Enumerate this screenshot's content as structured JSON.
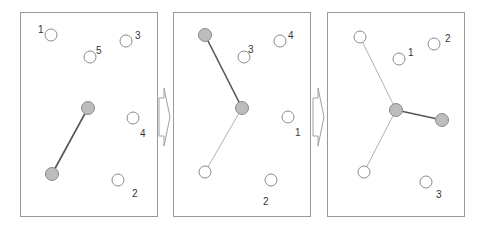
{
  "figure": {
    "colors": {
      "frame": "#9a9a9a",
      "open_node_fill": "#ffffff",
      "filled_node_fill": "#bdbdbd",
      "strong_edge": "#555555",
      "weak_edge": "#a8a8a8",
      "label": "#333333"
    },
    "panels": [
      {
        "id": "step-1",
        "labels": [
          {
            "text": "1",
            "x": 38,
            "y": 33
          },
          {
            "text": "5",
            "x": 96,
            "y": 54
          },
          {
            "text": "3",
            "x": 135,
            "y": 39
          },
          {
            "text": "4",
            "x": 140,
            "y": 137
          },
          {
            "text": "2",
            "x": 132,
            "y": 197
          }
        ]
      },
      {
        "id": "step-2",
        "labels": [
          {
            "text": "3",
            "x": 248,
            "y": 53
          },
          {
            "text": "4",
            "x": 288,
            "y": 39
          },
          {
            "text": "1",
            "x": 295,
            "y": 136
          },
          {
            "text": "2",
            "x": 263,
            "y": 205
          }
        ]
      },
      {
        "id": "step-3",
        "labels": [
          {
            "text": "1",
            "x": 408,
            "y": 56
          },
          {
            "text": "2",
            "x": 445,
            "y": 42
          },
          {
            "text": "3",
            "x": 436,
            "y": 198
          }
        ]
      }
    ],
    "arrows": [
      {
        "from": "step-1",
        "to": "step-2",
        "direction": "right"
      },
      {
        "from": "step-2",
        "to": "step-3",
        "direction": "right"
      }
    ]
  }
}
